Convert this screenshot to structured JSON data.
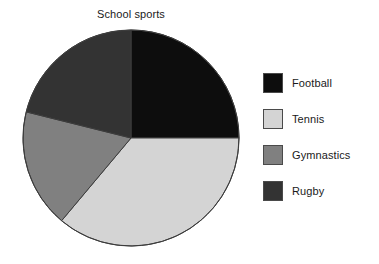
{
  "chart_data": {
    "type": "pie",
    "title": "School sports",
    "xlabel": "",
    "ylabel": "",
    "legend_position": "right",
    "grid": false,
    "start_angle_deg": 0,
    "direction": "clockwise",
    "categories": [
      "Football",
      "Tennis",
      "Gymnastics",
      "Rugby"
    ],
    "values": [
      25,
      36,
      18,
      21
    ],
    "units": "percent",
    "slices": [
      {
        "label": "Football",
        "value": 25,
        "start_angle_deg": 0,
        "end_angle_deg": 90,
        "color": "#0d0d0d"
      },
      {
        "label": "Tennis",
        "value": 36,
        "start_angle_deg": 90,
        "end_angle_deg": 220,
        "color": "#d4d4d4"
      },
      {
        "label": "Gymnastics",
        "value": 18,
        "start_angle_deg": 220,
        "end_angle_deg": 284,
        "color": "#808080"
      },
      {
        "label": "Rugby",
        "value": 21,
        "start_angle_deg": 284,
        "end_angle_deg": 360,
        "color": "#333333"
      }
    ]
  },
  "legend": {
    "items": [
      {
        "label": "Football",
        "color": "#0d0d0d"
      },
      {
        "label": "Tennis",
        "color": "#d4d4d4"
      },
      {
        "label": "Gymnastics",
        "color": "#808080"
      },
      {
        "label": "Rugby",
        "color": "#333333"
      }
    ]
  },
  "geometry": {
    "center_x": 131,
    "center_y": 138,
    "radius": 108,
    "outline_color": "#3c3c3c"
  }
}
